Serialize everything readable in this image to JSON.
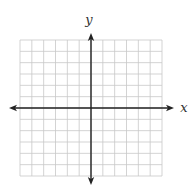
{
  "diagram": {
    "type": "coordinate-plane",
    "grid": {
      "columns": 12,
      "rows": 12,
      "left": 20,
      "top": 40,
      "right": 162,
      "bottom": 176,
      "line_color": "#c8c8c8",
      "line_width": 0.8
    },
    "axes": {
      "color": "#222222",
      "line_width": 1.4,
      "x_axis": {
        "y": 108,
        "x_start": 9,
        "x_end": 174,
        "label": "x",
        "label_x": 184,
        "label_y": 112
      },
      "y_axis": {
        "x": 91,
        "y_start": 33,
        "y_end": 185,
        "label": "y",
        "label_x": 89,
        "label_y": 24
      },
      "arrows": [
        "left",
        "right",
        "up",
        "down"
      ]
    },
    "origin_cell_offset": {
      "columns_left_of_y_axis": 6,
      "rows_above_x_axis": 6
    }
  }
}
